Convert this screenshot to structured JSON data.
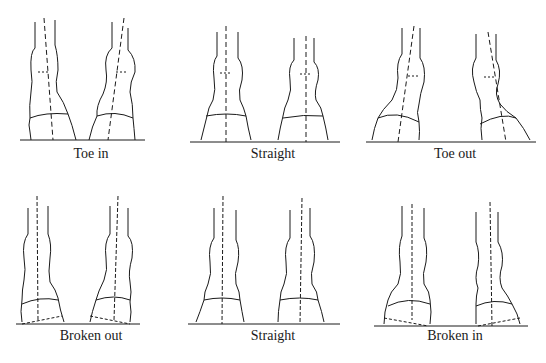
{
  "diagram": {
    "title": "",
    "rows": [
      {
        "panels": [
          {
            "id": "toe-in",
            "caption": "Toe in"
          },
          {
            "id": "straight-top",
            "caption": "Straight"
          },
          {
            "id": "toe-out",
            "caption": "Toe out"
          }
        ]
      },
      {
        "panels": [
          {
            "id": "broken-out",
            "caption": "Broken out"
          },
          {
            "id": "straight-bottom",
            "caption": "Straight"
          },
          {
            "id": "broken-in",
            "caption": "Broken in"
          }
        ]
      }
    ],
    "colors": {
      "ink": "#1a1a1a",
      "background": "#ffffff"
    }
  }
}
